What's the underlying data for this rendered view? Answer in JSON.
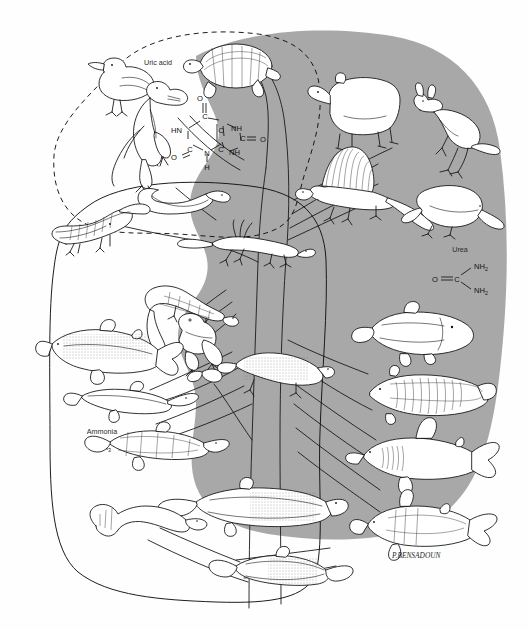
{
  "figure": {
    "domain_type": "diagram",
    "background_color": "#fefefe",
    "amniote_blob_color": "#a8a8a8",
    "line_color": "#111111"
  },
  "labels": {
    "uric_acid": "Uric acid",
    "urea": "Urea",
    "ammonia": "Ammonia",
    "ammonia_formula": "NH",
    "ammonia_formula_sub": "3",
    "signature": "P.BENSADOUN"
  },
  "uric_acid_structure": {
    "atoms": [
      {
        "id": "o_top",
        "text": "O"
      },
      {
        "id": "c_top",
        "text": "C"
      },
      {
        "id": "hn_left",
        "text": "HN"
      },
      {
        "id": "c_right",
        "text": "C"
      },
      {
        "id": "nh_right",
        "text": "NH"
      },
      {
        "id": "c_carbonyl",
        "text": "C"
      },
      {
        "id": "o_right",
        "text": "O"
      },
      {
        "id": "nh_lower",
        "text": "NH"
      },
      {
        "id": "c_lowerright",
        "text": "C"
      },
      {
        "id": "n_bottom",
        "text": "N"
      },
      {
        "id": "h_bottom",
        "text": "H"
      },
      {
        "id": "c_lowerleft",
        "text": "C"
      },
      {
        "id": "o_left",
        "text": "O"
      }
    ]
  },
  "urea_structure": {
    "atoms": [
      {
        "id": "o",
        "text": "O"
      },
      {
        "id": "c",
        "text": "C"
      },
      {
        "id": "nh2_upper",
        "text": "NH",
        "sub": "2"
      },
      {
        "id": "nh2_lower",
        "text": "NH",
        "sub": "2"
      }
    ]
  },
  "groupings": [
    {
      "id": "uricotelic",
      "style": "dashed",
      "label_ref": "uric_acid"
    },
    {
      "id": "ammonotelic",
      "style": "solid",
      "label_ref": "ammonia"
    },
    {
      "id": "ureotelic-amniote-blob",
      "style": "filled-gray",
      "label_ref": "urea"
    }
  ],
  "organisms": [
    {
      "id": "bird",
      "name": "bird-duck",
      "group": "uricotelic"
    },
    {
      "id": "dinosaur",
      "name": "theropod-dinosaur",
      "group": "uricotelic"
    },
    {
      "id": "turtle",
      "name": "turtle",
      "group": "uricotelic"
    },
    {
      "id": "snake",
      "name": "snake",
      "group": "uricotelic"
    },
    {
      "id": "crocodile",
      "name": "crocodile",
      "group": "uricotelic"
    },
    {
      "id": "lizard",
      "name": "lizard",
      "group": "uricotelic"
    },
    {
      "id": "bear",
      "name": "bear",
      "group": "ureotelic"
    },
    {
      "id": "kangaroo",
      "name": "kangaroo",
      "group": "ureotelic"
    },
    {
      "id": "dimetrodon",
      "name": "dimetrodon",
      "group": "ureotelic"
    },
    {
      "id": "platypus",
      "name": "platypus",
      "group": "ureotelic"
    },
    {
      "id": "coelacanth",
      "name": "coelacanth",
      "group": "ureotelic"
    },
    {
      "id": "lungfish",
      "name": "lungfish",
      "group": "ureotelic"
    },
    {
      "id": "shark",
      "name": "shark",
      "group": "ureotelic"
    },
    {
      "id": "chimaera",
      "name": "chimaera-ratfish",
      "group": "ureotelic"
    },
    {
      "id": "salamander",
      "name": "salamander",
      "group": "ammonotelic"
    },
    {
      "id": "frog",
      "name": "frog",
      "group": "ammonotelic"
    },
    {
      "id": "lab-newt",
      "name": "larval-amphibian",
      "group": "ammonotelic"
    },
    {
      "id": "trout",
      "name": "trout-teleost",
      "group": "ammonotelic"
    },
    {
      "id": "gar",
      "name": "gar",
      "group": "ammonotelic"
    },
    {
      "id": "sturgeon",
      "name": "sturgeon",
      "group": "ammonotelic"
    },
    {
      "id": "lamprey",
      "name": "lamprey",
      "group": "ammonotelic"
    },
    {
      "id": "placoderm",
      "name": "placoderm",
      "group": "ammonotelic"
    },
    {
      "id": "ostracoderm",
      "name": "ostracoderm",
      "group": "ammonotelic"
    }
  ]
}
